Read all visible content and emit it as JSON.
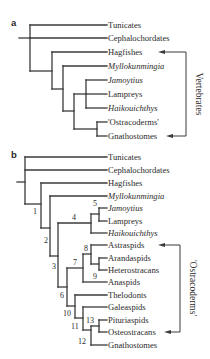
{
  "figure": {
    "panels": [
      {
        "id": "a",
        "label": "a",
        "label_pos": [
          11,
          26
        ],
        "taxa": [
          {
            "name": "Tunicates",
            "italic": false,
            "y": 25
          },
          {
            "name": "Cephalochordates",
            "italic": false,
            "y": 38
          },
          {
            "name": "Hagfishes",
            "italic": false,
            "y": 52
          },
          {
            "name": "Myllokunmingia",
            "italic": true,
            "y": 66
          },
          {
            "name": "Jamoytius",
            "italic": true,
            "y": 80
          },
          {
            "name": "Lampreys",
            "italic": false,
            "y": 94
          },
          {
            "name": "Haikouichthys",
            "italic": true,
            "y": 108
          },
          {
            "name": "'Ostracoderms'",
            "italic": false,
            "y": 122
          },
          {
            "name": "Gnathostomes",
            "italic": false,
            "y": 136
          }
        ],
        "tip_x": 107,
        "root_stub": [
          [
            19,
            38
          ],
          [
            30,
            38
          ]
        ],
        "branches": [
          [
            [
              30,
              25
            ],
            [
              30,
              71
            ]
          ],
          [
            [
              30,
              25
            ],
            [
              107,
              25
            ]
          ],
          [
            [
              30,
              38
            ],
            [
              107,
              38
            ]
          ],
          [
            [
              30,
              71
            ],
            [
              52,
              71
            ]
          ],
          [
            [
              52,
              52
            ],
            [
              52,
              89
            ]
          ],
          [
            [
              52,
              52
            ],
            [
              107,
              52
            ]
          ],
          [
            [
              52,
              89
            ],
            [
              63,
              89
            ]
          ],
          [
            [
              63,
              66
            ],
            [
              63,
              111
            ]
          ],
          [
            [
              63,
              66
            ],
            [
              107,
              66
            ]
          ],
          [
            [
              63,
              111
            ],
            [
              74,
              111
            ]
          ],
          [
            [
              74,
              94
            ],
            [
              74,
              129
            ]
          ],
          [
            [
              74,
              94
            ],
            [
              86,
              94
            ]
          ],
          [
            [
              86,
              80
            ],
            [
              86,
              108
            ]
          ],
          [
            [
              86,
              80
            ],
            [
              107,
              80
            ]
          ],
          [
            [
              86,
              94
            ],
            [
              107,
              94
            ]
          ],
          [
            [
              86,
              108
            ],
            [
              107,
              108
            ]
          ],
          [
            [
              74,
              129
            ],
            [
              97,
              129
            ]
          ],
          [
            [
              97,
              122
            ],
            [
              97,
              136
            ]
          ],
          [
            [
              97,
              122
            ],
            [
              107,
              122
            ]
          ],
          [
            [
              97,
              136
            ],
            [
              107,
              136
            ]
          ]
        ],
        "node_labels": [],
        "bracket": {
          "label": "Vertebrates",
          "x": 186,
          "y_top": 52,
          "y_bottom": 136,
          "arrow_top_x": 158,
          "arrow_bottom_x": 166,
          "label_x": 196,
          "label_y": 94
        }
      },
      {
        "id": "b",
        "label": "b",
        "label_pos": [
          11,
          158
        ],
        "taxa": [
          {
            "name": "Tunicates",
            "italic": false,
            "y": 157
          },
          {
            "name": "Cephalochordates",
            "italic": false,
            "y": 170
          },
          {
            "name": "Hagfishes",
            "italic": false,
            "y": 183
          },
          {
            "name": "Myllokunmingia",
            "italic": true,
            "y": 196
          },
          {
            "name": "Jamoytius",
            "italic": true,
            "y": 208
          },
          {
            "name": "Lampreys",
            "italic": false,
            "y": 221
          },
          {
            "name": "Haikouichthys",
            "italic": true,
            "y": 233
          },
          {
            "name": "Astraspids",
            "italic": false,
            "y": 245
          },
          {
            "name": "Arandaspids",
            "italic": false,
            "y": 258
          },
          {
            "name": "Heterostracans",
            "italic": false,
            "y": 270
          },
          {
            "name": "Anaspids",
            "italic": false,
            "y": 282
          },
          {
            "name": "Thelodonts",
            "italic": false,
            "y": 295
          },
          {
            "name": "Galeaspids",
            "italic": false,
            "y": 307
          },
          {
            "name": "Pituriaspids",
            "italic": false,
            "y": 320
          },
          {
            "name": "Osteostracans",
            "italic": false,
            "y": 332
          },
          {
            "name": "Gnathostomes",
            "italic": false,
            "y": 345
          }
        ],
        "tip_x": 107,
        "root_stub": [
          [
            17,
            182
          ],
          [
            25,
            182
          ]
        ],
        "branches": [
          [
            [
              25,
              157
            ],
            [
              25,
              204
            ]
          ],
          [
            [
              25,
              157
            ],
            [
              107,
              157
            ]
          ],
          [
            [
              25,
              170
            ],
            [
              107,
              170
            ]
          ],
          [
            [
              25,
              204
            ],
            [
              41,
              204
            ]
          ],
          [
            [
              41,
              183
            ],
            [
              41,
              228
            ]
          ],
          [
            [
              41,
              183
            ],
            [
              107,
              183
            ]
          ],
          [
            [
              41,
              228
            ],
            [
              50,
              228
            ]
          ],
          [
            [
              50,
              196
            ],
            [
              50,
              256
            ]
          ],
          [
            [
              50,
              196
            ],
            [
              107,
              196
            ]
          ],
          [
            [
              50,
              256
            ],
            [
              58,
              256
            ]
          ],
          [
            [
              58,
              223
            ],
            [
              58,
              287
            ]
          ],
          [
            [
              58,
              223
            ],
            [
              91,
              223
            ]
          ],
          [
            [
              91,
              214
            ],
            [
              91,
              233
            ]
          ],
          [
            [
              91,
              214
            ],
            [
              99,
              214
            ]
          ],
          [
            [
              91,
              233
            ],
            [
              107,
              233
            ]
          ],
          [
            [
              99,
              208
            ],
            [
              99,
              221
            ]
          ],
          [
            [
              99,
              208
            ],
            [
              107,
              208
            ]
          ],
          [
            [
              99,
              221
            ],
            [
              107,
              221
            ]
          ],
          [
            [
              58,
              287
            ],
            [
              67,
              287
            ]
          ],
          [
            [
              67,
              268
            ],
            [
              67,
              306
            ]
          ],
          [
            [
              67,
              268
            ],
            [
              83,
              268
            ]
          ],
          [
            [
              83,
              254
            ],
            [
              83,
              282
            ]
          ],
          [
            [
              83,
              282
            ],
            [
              107,
              282
            ]
          ],
          [
            [
              83,
              254
            ],
            [
              91,
              254
            ]
          ],
          [
            [
              91,
              245
            ],
            [
              91,
              264
            ]
          ],
          [
            [
              91,
              245
            ],
            [
              107,
              245
            ]
          ],
          [
            [
              91,
              264
            ],
            [
              99,
              264
            ]
          ],
          [
            [
              99,
              258
            ],
            [
              99,
              270
            ]
          ],
          [
            [
              99,
              258
            ],
            [
              107,
              258
            ]
          ],
          [
            [
              99,
              270
            ],
            [
              107,
              270
            ]
          ],
          [
            [
              67,
              306
            ],
            [
              75,
              306
            ]
          ],
          [
            [
              75,
              295
            ],
            [
              75,
              318
            ]
          ],
          [
            [
              75,
              295
            ],
            [
              107,
              295
            ]
          ],
          [
            [
              75,
              318
            ],
            [
              83,
              318
            ]
          ],
          [
            [
              83,
              307
            ],
            [
              83,
              330
            ]
          ],
          [
            [
              83,
              307
            ],
            [
              107,
              307
            ]
          ],
          [
            [
              83,
              330
            ],
            [
              91,
              330
            ]
          ],
          [
            [
              91,
              326
            ],
            [
              91,
              345
            ]
          ],
          [
            [
              91,
              326
            ],
            [
              99,
              326
            ]
          ],
          [
            [
              91,
              345
            ],
            [
              107,
              345
            ]
          ],
          [
            [
              99,
              320
            ],
            [
              99,
              332
            ]
          ],
          [
            [
              99,
              320
            ],
            [
              107,
              320
            ]
          ],
          [
            [
              99,
              332
            ],
            [
              107,
              332
            ]
          ]
        ],
        "node_labels": [
          {
            "text": "1",
            "x": 33,
            "y": 214
          },
          {
            "text": "2",
            "x": 44,
            "y": 243
          },
          {
            "text": "3",
            "x": 52,
            "y": 269
          },
          {
            "text": "4",
            "x": 72,
            "y": 220
          },
          {
            "text": "5",
            "x": 93,
            "y": 206
          },
          {
            "text": "6",
            "x": 60,
            "y": 298
          },
          {
            "text": "7",
            "x": 73,
            "y": 265
          },
          {
            "text": "8",
            "x": 84,
            "y": 251
          },
          {
            "text": "9",
            "x": 93,
            "y": 279
          },
          {
            "text": "10",
            "x": 63,
            "y": 316
          },
          {
            "text": "11",
            "x": 71,
            "y": 329
          },
          {
            "text": "12",
            "x": 78,
            "y": 344
          },
          {
            "text": "13",
            "x": 86,
            "y": 323
          }
        ],
        "bracket": {
          "label": "'Ostracoderms'",
          "x": 180,
          "y_top": 245,
          "y_bottom": 332,
          "arrow_top_x": 158,
          "arrow_bottom_x": 164,
          "label_x": 190,
          "label_y": 288
        }
      }
    ]
  }
}
